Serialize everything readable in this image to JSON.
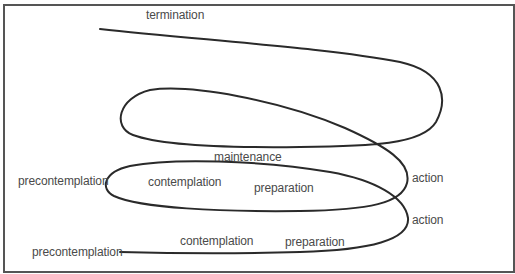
{
  "diagram": {
    "type": "spiral-model-of-change",
    "line_color": "#2a2a2a",
    "text_color": "#4a4a4a",
    "border_color": "#555555",
    "labels": {
      "termination": "termination",
      "maintenance": "maintenance",
      "precontemplation_upper": "precontemplation",
      "contemplation_upper": "contemplation",
      "preparation_upper": "preparation",
      "action_upper": "action",
      "action_lower": "action",
      "precontemplation_lower": "precontemplation",
      "contemplation_lower": "contemplation",
      "preparation_lower": "preparation"
    }
  }
}
